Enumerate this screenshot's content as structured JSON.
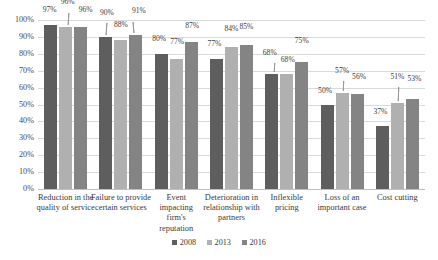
{
  "chart_data": {
    "type": "bar",
    "title": "",
    "subtitle": "",
    "xlabel": "",
    "ylabel": "",
    "ylim": [
      0,
      100
    ],
    "ytick_step": 10,
    "grid": true,
    "legend_position": "bottom",
    "value_suffix": "%",
    "categories": [
      "Reduction in the quality of service",
      "Failure to provide certain services",
      "Event impacting firm's reputation",
      "Deterioration in relationship with partners",
      "Inflexible pricing",
      "Loss of an important case",
      "Cost cutting"
    ],
    "ytick_labels": [
      "100%",
      "90%",
      "80%",
      "70%",
      "60%",
      "50%",
      "40%",
      "30%",
      "20%",
      "10%",
      "0%"
    ],
    "series": [
      {
        "name": "2008",
        "color": "#5e5e5e",
        "values": [
          97,
          90,
          80,
          77,
          68,
          50,
          37
        ]
      },
      {
        "name": "2013",
        "color": "#b0b0b0",
        "values": [
          96,
          88,
          77,
          84,
          68,
          57,
          51
        ]
      },
      {
        "name": "2016",
        "color": "#848484",
        "values": [
          96,
          91,
          87,
          85,
          75,
          56,
          53
        ]
      }
    ],
    "data_labels": [
      [
        "97%",
        "96%",
        "96%"
      ],
      [
        "90%",
        "88%",
        "91%"
      ],
      [
        "80%",
        "77%",
        "87%"
      ],
      [
        "77%",
        "84%",
        "85%"
      ],
      [
        "68%",
        "68%",
        "75%"
      ],
      [
        "50%",
        "57%",
        "56%"
      ],
      [
        "37%",
        "51%",
        "53%"
      ]
    ]
  },
  "legend": {
    "items": [
      {
        "label": "2008"
      },
      {
        "label": "2013"
      },
      {
        "label": "2016"
      }
    ]
  }
}
